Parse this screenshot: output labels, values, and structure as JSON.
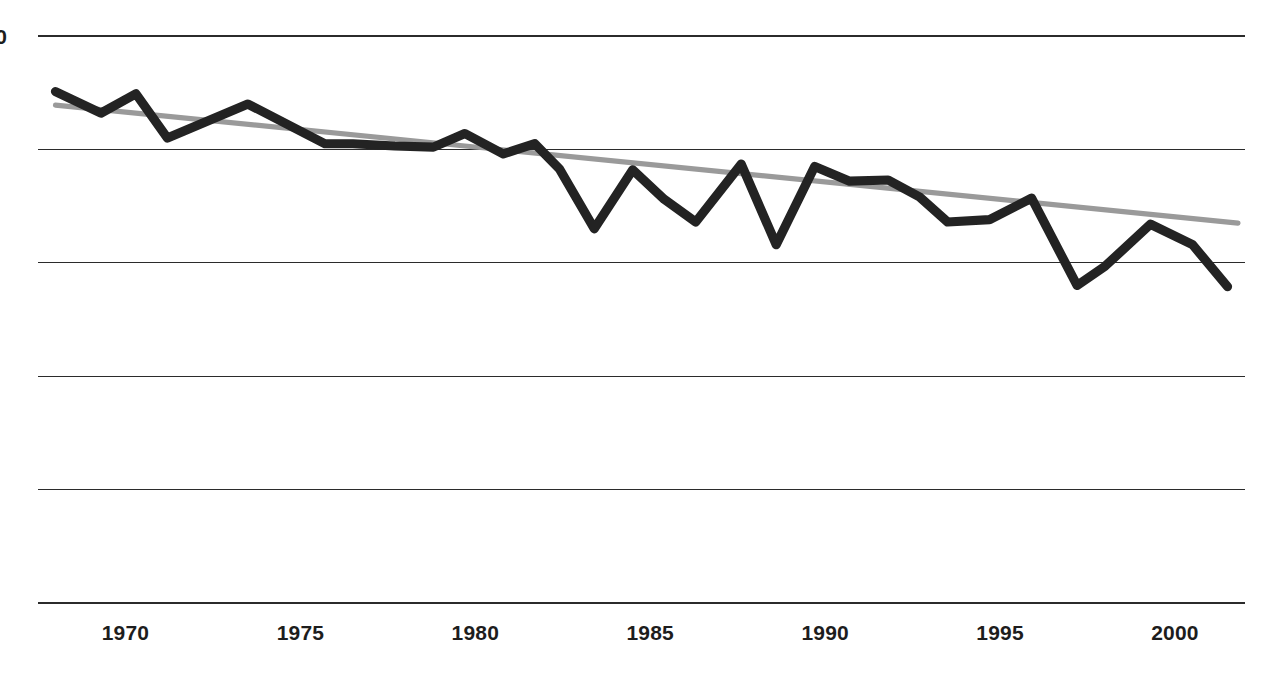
{
  "chart_data": {
    "type": "line",
    "title": "",
    "subtitle": "",
    "xlabel": "",
    "ylabel": "",
    "xlim": [
      1967.5,
      2002.0
    ],
    "ylim": [
      50,
      100
    ],
    "grid": true,
    "grid_orientation": "horizontal",
    "legend": null,
    "legend_position": "none",
    "xtick_labels": [
      "1970",
      "1975",
      "1980",
      "1985",
      "1990",
      "1995",
      "2000"
    ],
    "xtick_values": [
      1970,
      1975,
      1980,
      1985,
      1990,
      1995,
      2000
    ],
    "ytick_labels": [
      "100",
      "90",
      "80",
      "70",
      "60",
      "50"
    ],
    "ytick_values": [
      100,
      90,
      80,
      70,
      60,
      50
    ],
    "ytick_labels_clipped": true,
    "ytick_visible_fragment": "0",
    "colors": {
      "series": "#232323",
      "trend": "#9a9a9a",
      "gridline": "#2b2b2b",
      "background": "#ffffff",
      "tick_text": "#1d1d1d"
    },
    "series": [
      {
        "name": "data",
        "style": "solid",
        "color": "#232323",
        "x": [
          1968.0,
          1969.3,
          1970.3,
          1971.2,
          1973.5,
          1975.7,
          1976.5,
          1977.7,
          1978.8,
          1979.7,
          1980.8,
          1981.7,
          1982.4,
          1983.4,
          1984.5,
          1985.4,
          1986.3,
          1987.6,
          1988.6,
          1989.7,
          1990.7,
          1991.8,
          1992.7,
          1993.5,
          1994.7,
          1995.9,
          1997.2,
          1998.0,
          1999.3,
          2000.5,
          2001.5
        ],
        "y": [
          95.1,
          93.2,
          94.9,
          91.0,
          94.0,
          90.5,
          90.5,
          90.3,
          90.2,
          91.4,
          89.6,
          90.5,
          88.3,
          83.0,
          88.2,
          85.6,
          83.6,
          88.7,
          81.6,
          88.5,
          87.2,
          87.3,
          85.8,
          83.6,
          83.8,
          85.7,
          78.0,
          79.7,
          83.4,
          81.6,
          77.9
        ]
      },
      {
        "name": "trend",
        "style": "solid",
        "color": "#9a9a9a",
        "x": [
          1968.0,
          2001.8
        ],
        "y": [
          93.9,
          83.5
        ]
      }
    ]
  }
}
